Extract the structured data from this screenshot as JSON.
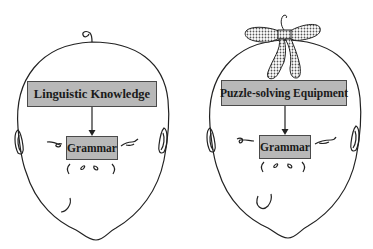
{
  "figure": {
    "left_head": {
      "top_box_label": "Linguistic Knowledge",
      "bottom_box_label": "Grammar",
      "accessory": "curl-of-hair"
    },
    "right_head": {
      "top_box_label": "Puzzle-solving Equipment",
      "bottom_box_label": "Grammar",
      "accessory": "dotted-bow"
    },
    "colors": {
      "box_fill": "#b8b8b8",
      "box_border": "#4a4a4a",
      "line": "#222222",
      "bow_dots": "#555555",
      "background": "#ffffff"
    }
  }
}
